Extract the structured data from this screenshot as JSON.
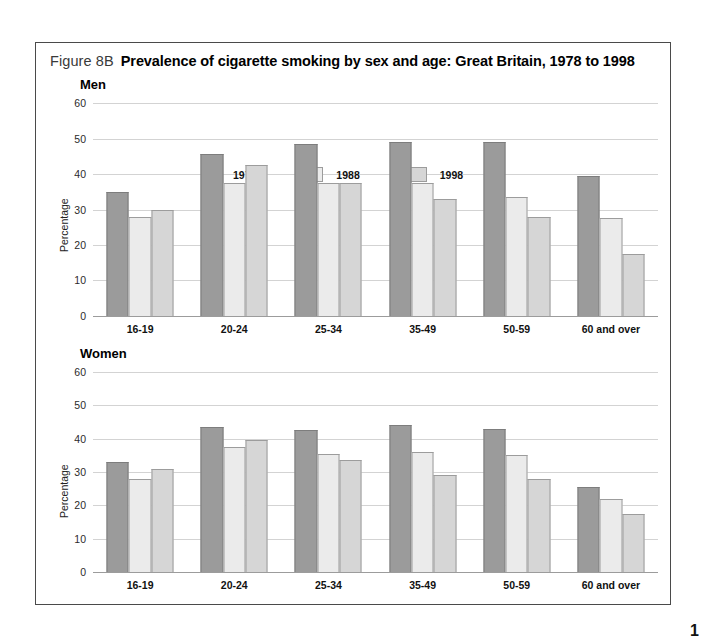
{
  "figure": {
    "label": "Figure 8B",
    "title": "Prevalence of cigarette smoking by sex and age:  Great Britain, 1978 to 1998"
  },
  "page_number": "1",
  "colors": {
    "series_1978": "#9b9b9b",
    "series_1988": "#ebebeb",
    "series_1998": "#d6d6d6",
    "gridline": "#d3d3d3",
    "frame": "#4a4a4a"
  },
  "legend": {
    "position": "top-left-inside-plot",
    "entries": [
      {
        "label": "1978",
        "swatch": "s0"
      },
      {
        "label": "1988",
        "swatch": "s1"
      },
      {
        "label": "1998",
        "swatch": "s2"
      }
    ]
  },
  "yticks": [
    "0",
    "10",
    "20",
    "30",
    "40",
    "50",
    "60"
  ],
  "chart_data": [
    {
      "type": "bar",
      "title": "Men",
      "xlabel": "",
      "ylabel": "Percentage",
      "ylim": [
        0,
        60
      ],
      "ytick_step": 10,
      "grid": true,
      "legend_position": "upper-left",
      "categories": [
        "16-19",
        "20-24",
        "25-34",
        "35-49",
        "50-59",
        "60 and over"
      ],
      "series": [
        {
          "name": "1978",
          "values": [
            35,
            45.5,
            48.5,
            49,
            49,
            39.5
          ]
        },
        {
          "name": "1988",
          "values": [
            28,
            37.5,
            37.5,
            37.5,
            33.5,
            27.5
          ]
        },
        {
          "name": "1998",
          "values": [
            30,
            42.5,
            37.5,
            33,
            28,
            17.5
          ]
        }
      ]
    },
    {
      "type": "bar",
      "title": "Women",
      "xlabel": "",
      "ylabel": "Percentage",
      "ylim": [
        0,
        60
      ],
      "ytick_step": 10,
      "grid": true,
      "legend_position": "none",
      "categories": [
        "16-19",
        "20-24",
        "25-34",
        "35-49",
        "50-59",
        "60 and over"
      ],
      "series": [
        {
          "name": "1978",
          "values": [
            33,
            43.5,
            42.5,
            44,
            43,
            25.5
          ]
        },
        {
          "name": "1988",
          "values": [
            28,
            37.5,
            35.5,
            36,
            35,
            22
          ]
        },
        {
          "name": "1998",
          "values": [
            31,
            39.5,
            33.5,
            29,
            28,
            17.5
          ]
        }
      ]
    }
  ]
}
